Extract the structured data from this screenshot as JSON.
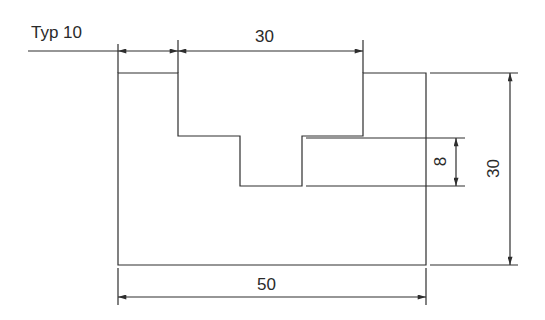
{
  "drawing": {
    "type": "mechanical dimensioned part profile",
    "labels": {
      "typ": "Typ 10",
      "top_width": "30",
      "bottom_width": "50",
      "right_height": "30",
      "slot_depth": "8"
    },
    "colors": {
      "line": "#2e2e2e",
      "background": "#ffffff"
    }
  }
}
